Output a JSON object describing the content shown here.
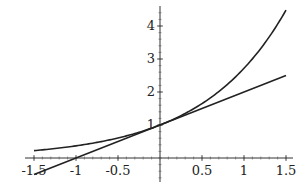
{
  "chart_data": {
    "type": "line",
    "title": "",
    "xlabel": "",
    "ylabel": "",
    "xlim": [
      -1.5,
      1.5
    ],
    "ylim": [
      -0.6,
      4.5
    ],
    "grid": false,
    "legend": null,
    "x_ticks": [
      -1.5,
      -1,
      -0.5,
      0.5,
      1,
      1.5
    ],
    "x_tick_labels": [
      "-1.5",
      "-1",
      "-0.5",
      "0.5",
      "1",
      "1.5"
    ],
    "y_ticks": [
      1,
      2,
      3,
      4
    ],
    "y_tick_labels": [
      "1",
      "2",
      "3",
      "4"
    ],
    "series": [
      {
        "name": "exp(x)",
        "x": [
          -1.5,
          -1.25,
          -1,
          -0.75,
          -0.5,
          -0.25,
          0,
          0.25,
          0.5,
          0.75,
          1,
          1.25,
          1.5
        ],
        "values": [
          0.223,
          0.287,
          0.368,
          0.472,
          0.607,
          0.779,
          1.0,
          1.284,
          1.649,
          2.117,
          2.718,
          3.49,
          4.482
        ],
        "color": "#222222"
      },
      {
        "name": "1 + x (tangent at 0)",
        "x": [
          -1.5,
          1.5
        ],
        "values": [
          -0.5,
          2.5
        ],
        "color": "#222222"
      }
    ]
  }
}
